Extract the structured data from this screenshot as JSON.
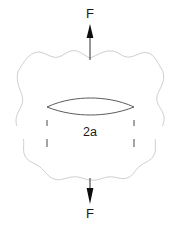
{
  "figure": {
    "background_color": "#ffffff",
    "width": 180,
    "height": 230
  },
  "labels": {
    "force_top": "F",
    "force_bottom": "F",
    "crack_length": "2a"
  },
  "colors": {
    "body_outline": "#c8c8c8",
    "crack_outline": "#404040",
    "annotation": "#1a1a1a",
    "text": "#1a1a1a",
    "background": "#ffffff"
  },
  "elements": {
    "body_outline_name": "irregular specimen boundary",
    "crack_name": "lenticular crack",
    "dimension_line_name": "crack length dimension 2a",
    "force_arrow_top_name": "tensile force arrow up",
    "force_arrow_bottom_name": "tensile force arrow down"
  },
  "geometry": {
    "crack_left_tip_x": 47,
    "crack_right_tip_x": 134,
    "crack_center_y": 107,
    "dimension_line_y": 133,
    "force_axis_x": 90,
    "body_top_y": 50,
    "body_bottom_y": 180,
    "body_left_x": 17,
    "body_right_x": 165
  }
}
